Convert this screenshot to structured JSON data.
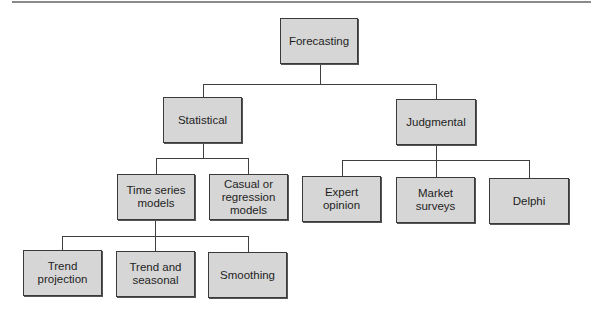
{
  "diagram": {
    "colors": {
      "box_fill": "#d6d6d6",
      "box_border": "#3a3a3a",
      "line": "#3f3f3f"
    },
    "nodes": {
      "forecasting": "Forecasting",
      "statistical": "Statistical",
      "judgmental": "Judgmental",
      "time_series": "Time series\nmodels",
      "casual_regression": "Casual or\nregression\nmodels",
      "expert_opinion": "Expert\nopinion",
      "market_surveys": "Market\nsurveys",
      "delphi": "Delphi",
      "trend_projection": "Trend\nprojection",
      "trend_seasonal": "Trend and\nseasonal",
      "smoothing": "Smoothing"
    },
    "edges": [
      [
        "Forecasting",
        "Statistical"
      ],
      [
        "Forecasting",
        "Judgmental"
      ],
      [
        "Statistical",
        "Time series models"
      ],
      [
        "Statistical",
        "Casual or regression models"
      ],
      [
        "Judgmental",
        "Expert opinion"
      ],
      [
        "Judgmental",
        "Market surveys"
      ],
      [
        "Judgmental",
        "Delphi"
      ],
      [
        "Time series models",
        "Trend projection"
      ],
      [
        "Time series models",
        "Trend and seasonal"
      ],
      [
        "Time series models",
        "Smoothing"
      ]
    ]
  }
}
